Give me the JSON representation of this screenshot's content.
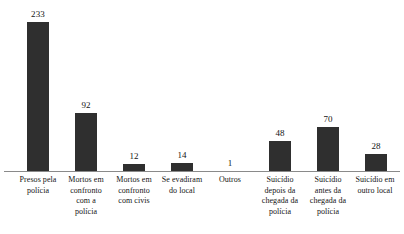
{
  "chart_data": {
    "type": "bar",
    "title": "",
    "subtitle": "",
    "xlabel": "",
    "ylabel": "",
    "ylim": [
      0,
      233
    ],
    "grid": false,
    "legend": null,
    "axis": {
      "baseline_visible": true,
      "y_axis_visible": false,
      "tick_labels": []
    },
    "value_labels_shown": true,
    "bar_color": "#2f2f2f",
    "axis_color": "#8a8a8a",
    "background_color": "#ffffff",
    "categories": [
      "Presos pela polícia",
      "Mortos em confronto com a polícia",
      "Mortos em confronto com civis",
      "Se evadiram do local",
      "Outros",
      "Suicídio depois da chegada da polícia",
      "Suicídio antes da chegada da polícia",
      "Suicídio em outro local"
    ],
    "values": [
      233,
      92,
      12,
      14,
      1,
      48,
      70,
      28
    ],
    "bars": [
      {
        "category": "Presos pela polícia",
        "value": 233,
        "value_text": "233",
        "label_lines": [
          "Presos pela",
          "polícia"
        ]
      },
      {
        "category": "Mortos em confronto com a polícia",
        "value": 92,
        "value_text": "92",
        "label_lines": [
          "Mortos em",
          "confronto",
          "com a",
          "polícia"
        ]
      },
      {
        "category": "Mortos em confronto com civis",
        "value": 12,
        "value_text": "12",
        "label_lines": [
          "Mortos em",
          "confronto",
          "com civis"
        ]
      },
      {
        "category": "Se evadiram do local",
        "value": 14,
        "value_text": "14",
        "label_lines": [
          "Se evadiram",
          "do local"
        ]
      },
      {
        "category": "Outros",
        "value": 1,
        "value_text": "1",
        "label_lines": [
          "Outros"
        ]
      },
      {
        "category": "Suicídio depois da chegada da polícia",
        "value": 48,
        "value_text": "48",
        "label_lines": [
          "Suicídio",
          "depois da",
          "chegada da",
          "polícia"
        ]
      },
      {
        "category": "Suicídio antes da chegada da polícia",
        "value": 70,
        "value_text": "70",
        "label_lines": [
          "Suicídio",
          "antes da",
          "chegada da",
          "polícia"
        ]
      },
      {
        "category": "Suicídio em outro local",
        "value": 28,
        "value_text": "28",
        "label_lines": [
          "Suicídio em",
          "outro local"
        ]
      }
    ]
  }
}
